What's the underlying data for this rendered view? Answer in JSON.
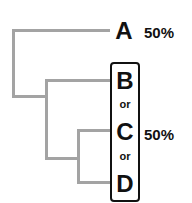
{
  "diagram": {
    "type": "phylogenetic-tree",
    "colors": {
      "branch": "#a3a3a3",
      "text": "#111111"
    },
    "leaves": [
      {
        "label": "A",
        "percent": "50%"
      },
      {
        "label": "B"
      },
      {
        "label": "C"
      },
      {
        "label": "D"
      }
    ],
    "group": {
      "labels": [
        "B",
        "or",
        "C",
        "or",
        "D"
      ],
      "percent": "50%"
    }
  }
}
